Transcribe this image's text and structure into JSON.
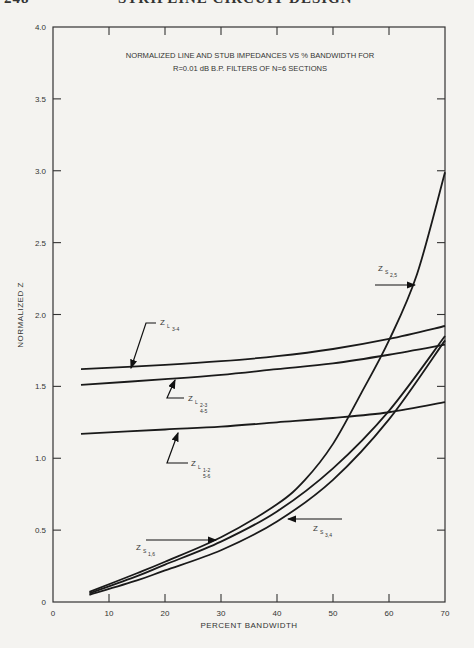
{
  "page": {
    "number": "248",
    "running_head": "STRIPLINE CIRCUIT DESIGN"
  },
  "chart_data": {
    "type": "line",
    "title": "NORMALIZED LINE AND STUB IMPEDANCES VS % BANDWIDTH FOR",
    "subtitle": "R=0.01 dB B.P. FILTERS OF N=6 SECTIONS",
    "xlabel": "PERCENT BANDWIDTH",
    "ylabel": "NORMALIZED Z",
    "xlim": [
      0,
      70
    ],
    "ylim": [
      0,
      4.0
    ],
    "x_ticks": [
      "0",
      "10",
      "20",
      "30",
      "40",
      "50",
      "60",
      "70"
    ],
    "y_ticks": [
      "0",
      "0.5",
      "1.0",
      "1.5",
      "2.0",
      "2.5",
      "3.0",
      "3.5",
      "4.0"
    ],
    "grid": false,
    "legend": "inline annotations with arrows",
    "series": [
      {
        "name": "Z_L3-4",
        "label_main": "Z",
        "label_sub": "L",
        "label_idx": "3-4",
        "label_idx2": "",
        "points": [
          [
            5,
            1.62
          ],
          [
            20,
            1.65
          ],
          [
            30,
            1.675
          ],
          [
            40,
            1.71
          ],
          [
            50,
            1.76
          ],
          [
            60,
            1.83
          ],
          [
            70,
            1.92
          ]
        ]
      },
      {
        "name": "Z_L2-3,4-5",
        "label_main": "Z",
        "label_sub": "L",
        "label_idx": "2-3",
        "label_idx2": "4-5",
        "points": [
          [
            5,
            1.51
          ],
          [
            20,
            1.55
          ],
          [
            30,
            1.58
          ],
          [
            40,
            1.62
          ],
          [
            50,
            1.66
          ],
          [
            60,
            1.72
          ],
          [
            70,
            1.79
          ]
        ]
      },
      {
        "name": "Z_L1-2,5-6",
        "label_main": "Z",
        "label_sub": "L",
        "label_idx": "1-2",
        "label_idx2": "5-6",
        "points": [
          [
            5,
            1.17
          ],
          [
            20,
            1.2
          ],
          [
            30,
            1.22
          ],
          [
            40,
            1.25
          ],
          [
            50,
            1.28
          ],
          [
            60,
            1.32
          ],
          [
            70,
            1.39
          ]
        ]
      },
      {
        "name": "Z_S2,5",
        "label_main": "Z",
        "label_sub": "S",
        "label_idx": "2,5",
        "label_idx2": "",
        "points": [
          [
            6.5,
            0.07
          ],
          [
            15,
            0.2
          ],
          [
            20,
            0.28
          ],
          [
            30,
            0.45
          ],
          [
            40,
            0.68
          ],
          [
            45,
            0.85
          ],
          [
            50,
            1.1
          ],
          [
            55,
            1.45
          ],
          [
            60,
            1.82
          ],
          [
            65,
            2.28
          ],
          [
            70,
            2.99
          ]
        ]
      },
      {
        "name": "Z_S1,6",
        "label_main": "Z",
        "label_sub": "S",
        "label_idx": "1,6",
        "label_idx2": "",
        "points": [
          [
            6.5,
            0.06
          ],
          [
            15,
            0.18
          ],
          [
            20,
            0.26
          ],
          [
            30,
            0.42
          ],
          [
            40,
            0.63
          ],
          [
            50,
            0.93
          ],
          [
            60,
            1.33
          ],
          [
            70,
            1.85
          ]
        ]
      },
      {
        "name": "Z_S3,4",
        "label_main": "Z",
        "label_sub": "S",
        "label_idx": "3,4",
        "label_idx2": "",
        "points": [
          [
            6.5,
            0.05
          ],
          [
            15,
            0.15
          ],
          [
            20,
            0.22
          ],
          [
            30,
            0.36
          ],
          [
            40,
            0.56
          ],
          [
            50,
            0.85
          ],
          [
            60,
            1.27
          ],
          [
            70,
            1.82
          ]
        ]
      }
    ]
  }
}
